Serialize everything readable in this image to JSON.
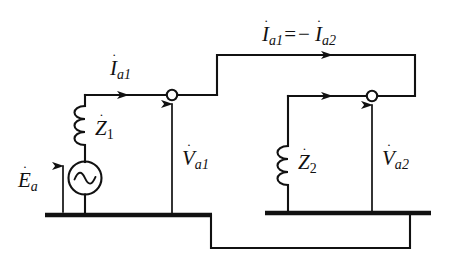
{
  "figure": {
    "name": "two-port-circuit-diagram",
    "background_color": "#ffffff",
    "line_color": "#111111",
    "width": 452,
    "height": 262
  },
  "labels": {
    "equation": {
      "name": "current-relation-equation",
      "symbol": "I",
      "dot": "˙",
      "sub1": "a1",
      "operator_equals": "=",
      "operator_minus": "−",
      "symbol2": "I",
      "sub2": "a2",
      "text": "İa1 = − İa2"
    },
    "current_ia1": {
      "name": "current-ia1",
      "symbol": "I",
      "dot": "˙",
      "sub": "a1",
      "text": "İa1"
    },
    "impedance_z1": {
      "name": "impedance-z1",
      "symbol": "Z",
      "dot": "˙",
      "sub": "1",
      "text": "Ż1"
    },
    "impedance_z2": {
      "name": "impedance-z2",
      "symbol": "Z",
      "dot": "˙",
      "sub": "2",
      "text": "Ż2"
    },
    "voltage_va1": {
      "name": "voltage-va1",
      "symbol": "V",
      "dot": "˙",
      "sub": "a1",
      "text": "V̇a1"
    },
    "voltage_va2": {
      "name": "voltage-va2",
      "symbol": "V",
      "dot": "˙",
      "sub": "a2",
      "text": "V̇a2"
    },
    "emf_ea": {
      "name": "emf-source-ea",
      "symbol": "E",
      "dot": "˙",
      "sub": "a",
      "text": "Ėa"
    }
  },
  "components": {
    "ac_source": {
      "name": "ac-voltage-source",
      "glyph": "sine-wave"
    },
    "inductor_z1": {
      "name": "inductor-coil-z1",
      "turns": 3
    },
    "inductor_z2": {
      "name": "inductor-coil-z2",
      "turns": 3
    },
    "terminal_1": {
      "name": "terminal-node-a1"
    },
    "terminal_2": {
      "name": "terminal-node-a2"
    },
    "bus_left": {
      "name": "reference-bus-left"
    },
    "bus_right": {
      "name": "reference-bus-right"
    }
  }
}
